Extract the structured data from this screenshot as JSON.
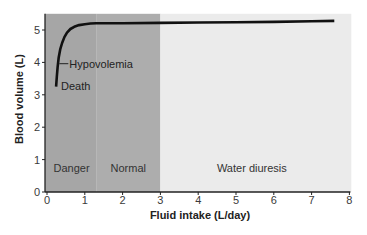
{
  "chart_data": {
    "type": "line",
    "title": "",
    "xlabel": "Fluid intake (L/day)",
    "ylabel": "Blood volume (L)",
    "xlim": [
      0,
      8
    ],
    "ylim": [
      0,
      5.5
    ],
    "xticks": [
      0,
      1,
      2,
      3,
      4,
      5,
      6,
      7,
      8
    ],
    "yticks": [
      0,
      1,
      2,
      3,
      4,
      5
    ],
    "grid": false,
    "legend": "none",
    "series": [
      {
        "name": "Blood volume",
        "color": "#111111",
        "x": [
          0.24,
          0.26,
          0.28,
          0.31,
          0.35,
          0.4,
          0.46,
          0.53,
          0.62,
          0.72,
          0.85,
          1.0,
          1.15,
          1.3,
          2.0,
          3.0,
          4.0,
          5.0,
          6.0,
          7.0,
          7.6
        ],
        "y": [
          3.25,
          3.55,
          3.85,
          4.15,
          4.4,
          4.6,
          4.78,
          4.92,
          5.03,
          5.1,
          5.15,
          5.18,
          5.2,
          5.21,
          5.21,
          5.22,
          5.23,
          5.24,
          5.25,
          5.27,
          5.28
        ]
      }
    ],
    "regions": [
      {
        "label": "Danger",
        "x": [
          0,
          1.3
        ],
        "color": "#a6a6a6"
      },
      {
        "label": "Normal",
        "x": [
          1.3,
          3.0
        ],
        "color": "#adadad"
      },
      {
        "label": "Water diuresis",
        "x": [
          3.0,
          8.05
        ],
        "color": "#ebebeb"
      }
    ],
    "annotations": [
      {
        "text": "Hypovolemia",
        "x": 0.3,
        "y": 3.96
      },
      {
        "text": "Death",
        "x": 0.24,
        "y": 3.25
      }
    ]
  }
}
